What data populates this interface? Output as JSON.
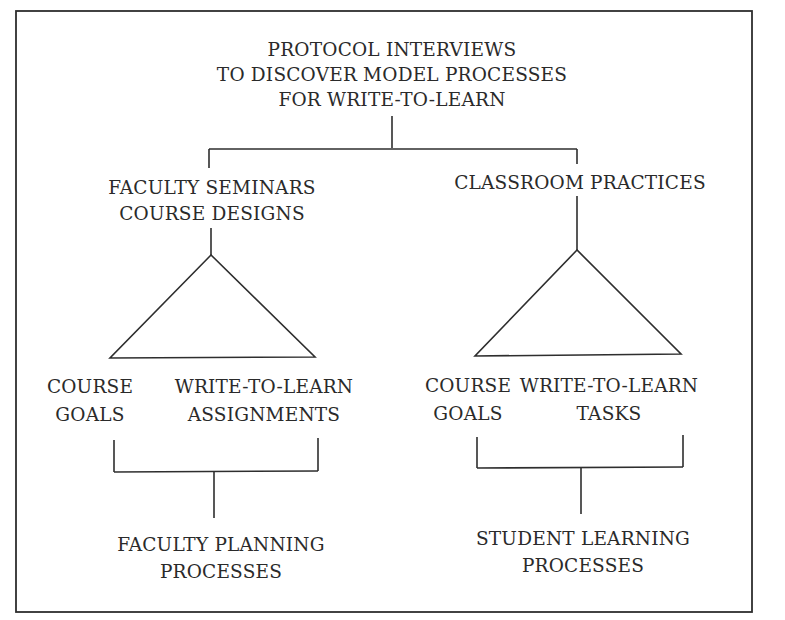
{
  "diagram": {
    "root": {
      "lines": [
        "PROTOCOL INTERVIEWS",
        "TO DISCOVER MODEL PROCESSES",
        "FOR WRITE-TO-LEARN"
      ]
    },
    "left_branch": {
      "title_lines": [
        "FACULTY SEMINARS",
        "COURSE DESIGNS"
      ],
      "child_a": {
        "lines": [
          "COURSE",
          "GOALS"
        ]
      },
      "child_b": {
        "lines": [
          "WRITE-TO-LEARN",
          "ASSIGNMENTS"
        ]
      },
      "outcome": {
        "lines": [
          "FACULTY PLANNING",
          "PROCESSES"
        ]
      }
    },
    "right_branch": {
      "title_lines": [
        "CLASSROOM PRACTICES"
      ],
      "child_a": {
        "lines": [
          "COURSE",
          "GOALS"
        ]
      },
      "child_b": {
        "lines": [
          "WRITE-TO-LEARN",
          "TASKS"
        ]
      },
      "outcome": {
        "lines": [
          "STUDENT LEARNING",
          "PROCESSES"
        ]
      }
    },
    "colors": {
      "ink": "#2e2e2e",
      "background": "#ffffff"
    }
  }
}
